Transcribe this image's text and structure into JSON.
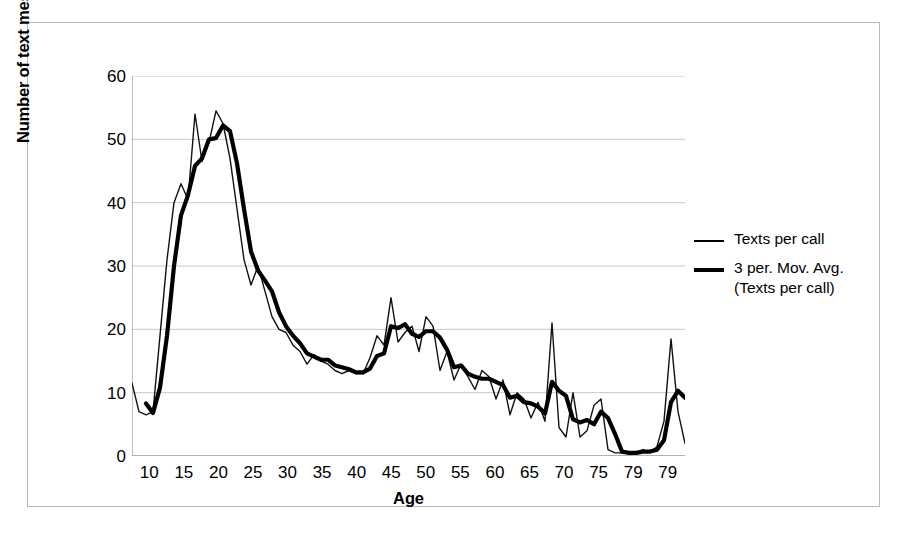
{
  "axes": {
    "x_title": "Age",
    "y_title": "Number of text messages per call",
    "y_ticks": [
      "60",
      "50",
      "40",
      "30",
      "20",
      "10",
      "0"
    ],
    "x_ticks": [
      "10",
      "15",
      "20",
      "25",
      "30",
      "35",
      "40",
      "45",
      "50",
      "55",
      "60",
      "65",
      "70",
      "75",
      "79",
      "79"
    ]
  },
  "legend": {
    "items": [
      {
        "label": "Texts per call",
        "style": "thin",
        "color": "#000000"
      },
      {
        "label": "3 per. Mov. Avg.\n(Texts per call)",
        "style": "thick",
        "color": "#000000"
      }
    ]
  },
  "chart_data": {
    "type": "line",
    "title": "",
    "xlabel": "Age",
    "ylabel": "Number of text messages per call",
    "xlim": [
      10,
      89
    ],
    "ylim": [
      0,
      60
    ],
    "ytick_step": 10,
    "grid": true,
    "legend_position": "right",
    "x": [
      10,
      11,
      12,
      13,
      14,
      15,
      16,
      17,
      18,
      19,
      20,
      21,
      22,
      23,
      24,
      25,
      26,
      27,
      28,
      29,
      30,
      31,
      32,
      33,
      34,
      35,
      36,
      37,
      38,
      39,
      40,
      41,
      42,
      43,
      44,
      45,
      46,
      47,
      48,
      49,
      50,
      51,
      52,
      53,
      54,
      55,
      56,
      57,
      58,
      59,
      60,
      61,
      62,
      63,
      64,
      65,
      66,
      67,
      68,
      69,
      70,
      71,
      72,
      73,
      74,
      75,
      76,
      77,
      78,
      79,
      80,
      81,
      82,
      83,
      84,
      85,
      86,
      87,
      88,
      89
    ],
    "series": [
      {
        "name": "Texts per call",
        "style": "thin",
        "values": [
          11.5,
          7.0,
          6.5,
          7.0,
          19.0,
          31.0,
          40.0,
          43.0,
          40.5,
          54.0,
          46.5,
          49.5,
          54.5,
          52.5,
          47.0,
          39.0,
          31.0,
          27.0,
          30.0,
          26.0,
          22.0,
          20.0,
          19.5,
          17.5,
          16.5,
          14.5,
          16.0,
          15.0,
          14.5,
          13.5,
          13.0,
          13.5,
          13.0,
          13.0,
          15.5,
          19.0,
          17.5,
          25.0,
          18.0,
          19.5,
          20.5,
          16.5,
          22.0,
          20.5,
          13.5,
          16.5,
          12.0,
          14.5,
          12.5,
          10.5,
          13.5,
          12.5,
          9.0,
          12.0,
          6.5,
          10.0,
          9.0,
          6.0,
          8.5,
          5.5,
          21.0,
          4.5,
          3.0,
          10.0,
          3.0,
          4.0,
          8.0,
          9.0,
          1.0,
          0.5,
          0.5,
          0.5,
          0.5,
          1.0,
          0.5,
          1.5,
          5.5,
          18.5,
          7.0,
          2.0
        ]
      },
      {
        "name": "3 per. Mov. Avg. (Texts per call)",
        "style": "thick",
        "values": [
          null,
          null,
          8.3,
          6.8,
          10.8,
          19.0,
          30.0,
          38.0,
          41.2,
          45.8,
          47.0,
          50.0,
          50.2,
          52.2,
          51.3,
          46.2,
          39.0,
          32.3,
          29.3,
          27.7,
          26.0,
          22.7,
          20.5,
          19.0,
          17.8,
          16.2,
          15.7,
          15.2,
          15.2,
          14.3,
          14.0,
          13.7,
          13.2,
          13.2,
          13.8,
          15.8,
          16.2,
          20.5,
          20.2,
          20.8,
          19.3,
          18.8,
          19.7,
          19.7,
          18.7,
          16.8,
          14.0,
          14.3,
          13.0,
          12.5,
          12.2,
          12.2,
          11.7,
          11.2,
          9.2,
          9.5,
          8.5,
          8.3,
          7.8,
          6.7,
          11.7,
          10.3,
          9.5,
          5.8,
          5.3,
          5.7,
          5.0,
          7.0,
          6.0,
          3.5,
          0.7,
          0.5,
          0.5,
          0.7,
          0.7,
          1.0,
          2.5,
          8.5,
          10.3,
          9.2
        ]
      }
    ]
  }
}
